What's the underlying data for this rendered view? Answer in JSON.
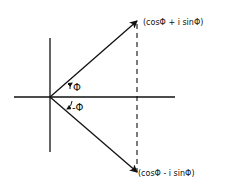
{
  "diagram": {
    "type": "complex-plane-phasor",
    "origin": {
      "x": 50,
      "y": 97
    },
    "axes": {
      "horizontal": {
        "x1": 14,
        "x2": 175,
        "y": 97
      },
      "vertical": {
        "x": 50,
        "y1": 38,
        "y2": 152
      }
    },
    "vectors": [
      {
        "name": "upper",
        "to": {
          "x": 137,
          "y": 21
        },
        "label": "(cosΦ + i sinΦ)"
      },
      {
        "name": "lower",
        "to": {
          "x": 137,
          "y": 172
        },
        "label": "(cosΦ - i sinΦ)"
      }
    ],
    "projection_line": {
      "x": 137,
      "y1": 22,
      "y2": 172,
      "style": "dashed"
    },
    "angle_labels": {
      "positive": "Φ",
      "negative": "-Φ"
    },
    "colors": {
      "ink": "#111111",
      "background": "#ffffff"
    }
  }
}
